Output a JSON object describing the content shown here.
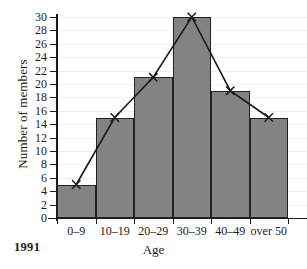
{
  "chart_data": {
    "type": "bar",
    "title": "",
    "subtitle": "",
    "xlabel": "Age",
    "ylabel": "Number of members",
    "categories": [
      "0–9",
      "10–19",
      "20–29",
      "30–39",
      "40–49",
      "over 50"
    ],
    "values": [
      5,
      15,
      21,
      30,
      19,
      15
    ],
    "series": [
      {
        "name": "Number of members",
        "type": "bar",
        "values": [
          5,
          15,
          21,
          30,
          19,
          15
        ]
      },
      {
        "name": "frequency-polygon",
        "type": "line",
        "marker": "x",
        "values": [
          5,
          15,
          21,
          30,
          19,
          15
        ]
      }
    ],
    "ylim": [
      0,
      30
    ],
    "ytick_step": 2,
    "yticks": [
      0,
      2,
      4,
      6,
      8,
      10,
      12,
      14,
      16,
      18,
      20,
      22,
      24,
      26,
      28,
      30
    ],
    "ytick_labels": [
      "0",
      "2",
      "4",
      "6",
      "8",
      "10",
      "12",
      "14",
      "16",
      "18",
      "20",
      "22",
      "24",
      "26",
      "28",
      "30"
    ],
    "grid": true,
    "grid_axis": "y",
    "legend": false,
    "legend_position": "none",
    "annotations": [
      {
        "name": "year",
        "text": "1991",
        "position": "bottom-left",
        "bold": true
      }
    ],
    "colors": {
      "bar_fill": "#838383",
      "bar_edge": "#222222",
      "line": "#1a1a1a",
      "marker": "#1a1a1a",
      "grid": "#eeeeee",
      "axis": "#1a1a1a",
      "background": "#ffffff",
      "text": "#1a1a1a"
    }
  },
  "annotation": {
    "year": "1991"
  }
}
